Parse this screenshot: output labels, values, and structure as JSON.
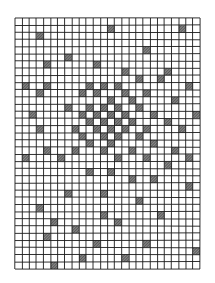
{
  "artwork": {
    "type": "hand-drawn grid with hatched cells",
    "columns": 26,
    "rows": 35,
    "line_color": "#1a1a1a",
    "fill_color": "#3a3a3a",
    "background": "#ffffff",
    "shaded_cells": [
      [
        3,
        2
      ],
      [
        13,
        1
      ],
      [
        7,
        5
      ],
      [
        18,
        4
      ],
      [
        21,
        7
      ],
      [
        23,
        1
      ],
      [
        4,
        6
      ],
      [
        11,
        6
      ],
      [
        15,
        7
      ],
      [
        17,
        8
      ],
      [
        14,
        9
      ],
      [
        20,
        8
      ],
      [
        1,
        9
      ],
      [
        4,
        9
      ],
      [
        10,
        9
      ],
      [
        12,
        9
      ],
      [
        15,
        10
      ],
      [
        18,
        10
      ],
      [
        24,
        9
      ],
      [
        3,
        10
      ],
      [
        9,
        10
      ],
      [
        11,
        10
      ],
      [
        13,
        11
      ],
      [
        16,
        11
      ],
      [
        22,
        11
      ],
      [
        7,
        12
      ],
      [
        10,
        12
      ],
      [
        12,
        12
      ],
      [
        14,
        12
      ],
      [
        17,
        12
      ],
      [
        2,
        13
      ],
      [
        9,
        13
      ],
      [
        11,
        13
      ],
      [
        13,
        13
      ],
      [
        15,
        13
      ],
      [
        19,
        13
      ],
      [
        25,
        13
      ],
      [
        10,
        14
      ],
      [
        12,
        14
      ],
      [
        14,
        14
      ],
      [
        16,
        14
      ],
      [
        21,
        14
      ],
      [
        3,
        15
      ],
      [
        8,
        15
      ],
      [
        11,
        15
      ],
      [
        13,
        15
      ],
      [
        15,
        15
      ],
      [
        18,
        15
      ],
      [
        23,
        15
      ],
      [
        9,
        16
      ],
      [
        12,
        16
      ],
      [
        14,
        16
      ],
      [
        17,
        16
      ],
      [
        10,
        17
      ],
      [
        13,
        17
      ],
      [
        19,
        17
      ],
      [
        4,
        18
      ],
      [
        8,
        18
      ],
      [
        12,
        18
      ],
      [
        16,
        18
      ],
      [
        22,
        18
      ],
      [
        1,
        19
      ],
      [
        6,
        19
      ],
      [
        14,
        19
      ],
      [
        18,
        19
      ],
      [
        24,
        19
      ],
      [
        10,
        21
      ],
      [
        13,
        21
      ],
      [
        21,
        20
      ],
      [
        16,
        22
      ],
      [
        19,
        22
      ],
      [
        24,
        23
      ],
      [
        7,
        24
      ],
      [
        12,
        24
      ],
      [
        17,
        25
      ],
      [
        3,
        26
      ],
      [
        20,
        27
      ],
      [
        12,
        27
      ],
      [
        5,
        28
      ],
      [
        14,
        28
      ],
      [
        8,
        29
      ],
      [
        4,
        30
      ],
      [
        18,
        31
      ],
      [
        11,
        31
      ],
      [
        25,
        32
      ],
      [
        9,
        33
      ],
      [
        15,
        33
      ],
      [
        5,
        34
      ]
    ]
  }
}
